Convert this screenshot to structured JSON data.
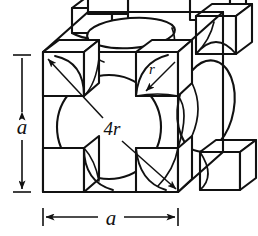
{
  "figure": {
    "kind": "fcc-unit-cell-hard-sphere-diagram",
    "title_visible": false,
    "background_color": "#ffffff",
    "line_color": "#111111",
    "fill_color": "#ffffff",
    "labels": {
      "edge_vertical": "a",
      "edge_horizontal": "a",
      "face_diagonal": "4r",
      "atom_radius": "r"
    },
    "dimensions": {
      "vertical": {
        "label": "a",
        "axis_x": 22,
        "y_top": 55,
        "y_bottom": 192,
        "tick_half_width": 9,
        "label_x": 22,
        "label_y": 126
      },
      "horizontal": {
        "label": "a",
        "axis_y": 217,
        "x_left": 43,
        "x_right": 178,
        "tick_half_height": 9,
        "label_x": 110,
        "label_y": 224
      }
    },
    "annotations": [
      {
        "name": "face-diagonal-4r",
        "label": "4r",
        "label_x": 112,
        "label_y": 134,
        "arrow_1": {
          "x1": 103,
          "y1": 118,
          "x2": 47,
          "y2": 58
        },
        "arrow_2": {
          "x1": 122,
          "y1": 140,
          "x2": 177,
          "y2": 190
        }
      },
      {
        "name": "radius-r",
        "label": "r",
        "label_x": 153,
        "label_y": 71,
        "arrow": {
          "x1": 176,
          "y1": 62,
          "x2": 145,
          "y2": 92
        }
      }
    ],
    "cube": {
      "front_face": {
        "left": 43,
        "top": 52,
        "right": 178,
        "bottom": 192
      },
      "depth_offset_x": 45,
      "depth_offset_y": -40
    },
    "atoms": {
      "face_front": {
        "cx": 109,
        "cy": 127,
        "r": 52
      },
      "face_top": {
        "cx": 131,
        "cy": 33,
        "rx": 44,
        "ry": 15,
        "rotation": -4
      },
      "face_right": {
        "cx": 206,
        "cy": 106,
        "rx": 28,
        "ry": 46,
        "rotation": 10
      },
      "corner_count": 8
    }
  }
}
